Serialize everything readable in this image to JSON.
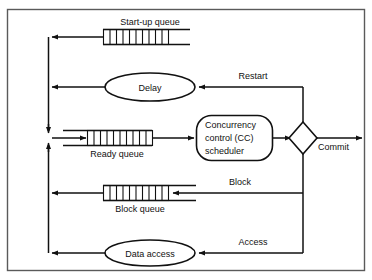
{
  "diagram": {
    "frame_color": "#5a5a5a",
    "line_color": "#111111",
    "background": "#ffffff",
    "nodes": {
      "startup_queue": {
        "label": "Start-up queue",
        "shape": "queue",
        "cells": 10
      },
      "delay": {
        "label": "Delay",
        "shape": "ellipse"
      },
      "ready_queue": {
        "label": "Ready queue",
        "shape": "queue",
        "cells": 10
      },
      "cc_scheduler": {
        "shape": "rounded-rect",
        "line1": "Concurrency",
        "line2": "control (CC)",
        "line3": "scheduler"
      },
      "decision": {
        "label": "",
        "shape": "diamond"
      },
      "block_queue": {
        "label": "Block queue",
        "shape": "queue",
        "cells": 10
      },
      "data_access": {
        "label": "Data access",
        "shape": "ellipse"
      }
    },
    "edges": {
      "commit": "Commit",
      "restart": "Restart",
      "block": "Block",
      "access": "Access"
    }
  }
}
